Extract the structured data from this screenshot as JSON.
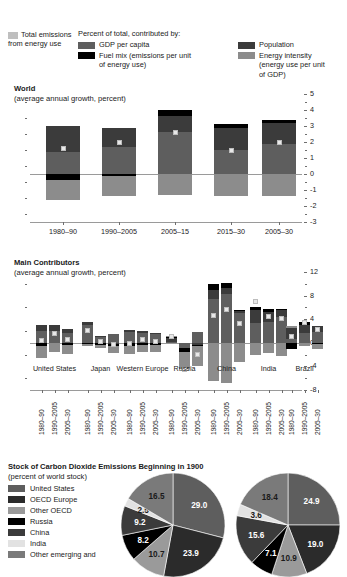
{
  "legend": {
    "total": {
      "label": "Total emissions\nfrom energy use",
      "color": "#bfbfbf"
    },
    "heading": "Percent of total, contributed by:",
    "items": [
      {
        "name": "gdp-per-capita",
        "label": "GDP per capita",
        "color": "#5e5e5e"
      },
      {
        "name": "fuel-mix",
        "label": "Fuel mix (emissions per unit\nof energy use)",
        "color": "#000000"
      },
      {
        "name": "population",
        "label": "Population",
        "color": "#3b3b3b"
      },
      {
        "name": "energy-intensity",
        "label": "Energy intensity\n(energy use per unit\nof GDP)",
        "color": "#8c8c8c"
      }
    ]
  },
  "world_chart": {
    "title": "World",
    "subtitle": "(average annual growth, percent)",
    "yticks": [
      "5",
      "4",
      "3",
      "2",
      "1",
      "0",
      "-1",
      "-2",
      "-3"
    ],
    "categories": [
      "1980–90",
      "1990–2005",
      "2005–15",
      "2015–30",
      "2005–30"
    ]
  },
  "contrib_chart": {
    "title": "Main Contributors",
    "subtitle": "(average annual growth, percent)",
    "yticks": [
      "12",
      "8",
      "4",
      "0",
      "-4",
      "-8"
    ],
    "groups": [
      "United\nStates",
      "Japan",
      "Western\nEurope",
      "Russia",
      "China",
      "India",
      "Brazil"
    ],
    "periods": [
      "1980–90",
      "1990–2005",
      "2005–30"
    ]
  },
  "pie_section": {
    "title": "Stock of Carbon Dioxide Emissions Beginning in 1900",
    "subtitle": "(percent of world stock)",
    "legend": [
      {
        "label": "United States",
        "color": "#5e5e5e"
      },
      {
        "label": "OECD Europe",
        "color": "#2b2b2b"
      },
      {
        "label": "Other OECD",
        "color": "#9a9a9a"
      },
      {
        "label": "Russia",
        "color": "#000000"
      },
      {
        "label": "China",
        "color": "#3b3b3b"
      },
      {
        "label": "India",
        "color": "#e2e2e2"
      },
      {
        "label": "Other emerging and",
        "color": "#7a7a7a"
      }
    ]
  },
  "chart_data": [
    {
      "type": "bar",
      "id": "world",
      "title": "World",
      "subtitle": "(average annual growth, percent)",
      "xlabel": "",
      "ylabel": "average annual growth, percent",
      "ylim": [
        -3,
        5
      ],
      "grid": false,
      "legend_position": "top",
      "categories": [
        "1980-90",
        "1990-2005",
        "2005-15",
        "2015-30",
        "2005-30"
      ],
      "series": [
        {
          "name": "GDP per capita",
          "color": "#5e5e5e",
          "values": [
            1.4,
            1.7,
            2.6,
            1.5,
            1.9
          ]
        },
        {
          "name": "Population",
          "color": "#3b3b3b",
          "values": [
            1.6,
            1.2,
            1.0,
            1.4,
            1.3
          ]
        },
        {
          "name": "Fuel mix",
          "color": "#000000",
          "values": [
            -0.4,
            -0.1,
            0.4,
            0.2,
            0.2
          ]
        },
        {
          "name": "Energy intensity",
          "color": "#8c8c8c",
          "values": [
            -1.2,
            -1.3,
            -1.3,
            -1.4,
            -1.4
          ]
        }
      ],
      "total_marker": {
        "name": "Total emissions from energy use",
        "color": "#e8e8e8",
        "values": [
          1.6,
          2.0,
          2.6,
          1.5,
          2.0
        ]
      }
    },
    {
      "type": "bar",
      "id": "main-contributors",
      "title": "Main Contributors",
      "subtitle": "(average annual growth, percent)",
      "xlabel": "",
      "ylabel": "average annual growth, percent",
      "ylim": [
        -8,
        12
      ],
      "grid": false,
      "groups": [
        "United States",
        "Japan",
        "Western Europe",
        "Russia",
        "China",
        "India",
        "Brazil"
      ],
      "periods": [
        "1980-90",
        "1990-2005",
        "2005-30"
      ],
      "series": [
        {
          "name": "GDP per capita",
          "color": "#5e5e5e",
          "values": [
            2.0,
            2.0,
            1.6,
            3.0,
            0.9,
            1.5,
            1.8,
            1.6,
            1.5,
            0.2,
            -0.8,
            1.9,
            7.5,
            8.3,
            5.0,
            3.4,
            3.5,
            4.4,
            0.6,
            1.6,
            1.9
          ]
        },
        {
          "name": "Population",
          "color": "#3b3b3b",
          "values": [
            1.0,
            1.1,
            0.8,
            0.6,
            0.3,
            -0.2,
            0.4,
            0.4,
            0.2,
            0.6,
            -0.1,
            -0.3,
            1.5,
            1.0,
            0.5,
            2.1,
            1.8,
            1.1,
            1.9,
            1.5,
            0.9
          ]
        },
        {
          "name": "Fuel mix",
          "color": "#000000",
          "values": [
            -0.6,
            0.0,
            -0.3,
            -0.2,
            -0.3,
            -0.4,
            -0.5,
            -0.3,
            -0.3,
            0.2,
            -0.7,
            -0.2,
            0.9,
            0.8,
            0.1,
            0.6,
            0.5,
            0.2,
            -1.1,
            0.4,
            -0.2
          ]
        },
        {
          "name": "Energy intensity",
          "color": "#8c8c8c",
          "values": [
            -2.0,
            -1.6,
            -1.6,
            -0.3,
            -0.6,
            -1.2,
            -1.4,
            -1.2,
            -1.2,
            0.1,
            -2.9,
            -3.4,
            -6.5,
            -6.8,
            -3.3,
            -2.0,
            -1.8,
            -2.2,
            0.4,
            -0.5,
            -0.8
          ]
        }
      ],
      "total_marker": {
        "name": "Total emissions from energy use",
        "color": "#e8e8e8",
        "values": [
          0.4,
          1.5,
          0.5,
          2.1,
          0.3,
          -0.3,
          -0.1,
          0.5,
          0.2,
          1.1,
          -4.5,
          -2.0,
          4.7,
          5.6,
          3.3,
          7.0,
          4.4,
          4.1,
          1.1,
          3.5,
          2.3
        ]
      }
    },
    {
      "type": "pie",
      "id": "stock-1900",
      "title": "Stock of Carbon Dioxide Emissions Beginning in 1900",
      "subtitle": "(percent of world stock)",
      "labels": [
        "United States",
        "OECD Europe",
        "Other OECD",
        "Russia",
        "China",
        "India",
        "Other emerging and"
      ],
      "pies": [
        {
          "name": "left",
          "values": [
            29.0,
            23.9,
            10.7,
            8.2,
            9.2,
            2.5,
            16.5
          ],
          "colors": [
            "#5e5e5e",
            "#2b2b2b",
            "#9a9a9a",
            "#000000",
            "#3b3b3b",
            "#e2e2e2",
            "#7a7a7a"
          ]
        },
        {
          "name": "right",
          "values": [
            24.9,
            19.0,
            10.9,
            7.1,
            15.6,
            3.6,
            18.4
          ],
          "colors": [
            "#5e5e5e",
            "#2b2b2b",
            "#9a9a9a",
            "#000000",
            "#3b3b3b",
            "#e2e2e2",
            "#7a7a7a"
          ]
        }
      ]
    }
  ]
}
